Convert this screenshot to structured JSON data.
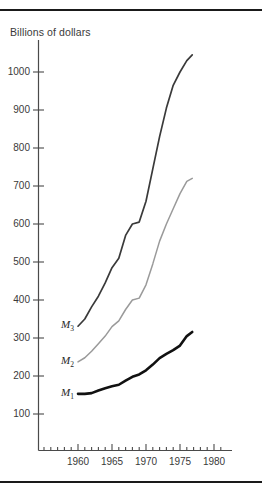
{
  "figure": {
    "axis_title": "Billions of dollars",
    "rule_color": "#1a1a1a"
  },
  "chart_data": {
    "type": "line",
    "title": "",
    "subtitle": "",
    "xlabel": "",
    "ylabel": "Billions of dollars",
    "xlim": [
      1954,
      1982
    ],
    "ylim": [
      0,
      1080
    ],
    "grid": false,
    "legend_position": "inline-left-of-curve-start",
    "yticks": [
      100,
      200,
      300,
      400,
      500,
      600,
      700,
      800,
      900,
      1000
    ],
    "ytick_labels": [
      "100",
      "200",
      "300",
      "400",
      "500",
      "600",
      "700",
      "800",
      "900",
      "1000"
    ],
    "xticks_major": [
      1960,
      1965,
      1970,
      1975,
      1980
    ],
    "xtick_labels": [
      "1960",
      "1965",
      "1970",
      "1975",
      "1980"
    ],
    "xticks_minor_start": 1955,
    "xticks_minor_end": 1981,
    "annotations": [
      {
        "text": "M3",
        "label_html": "M<sub>3</sub>",
        "x": 1960.0,
        "y": 331
      },
      {
        "text": "M2",
        "label_html": "M<sub>2</sub>",
        "x": 1960.0,
        "y": 237
      },
      {
        "text": "M1",
        "label_html": "M<sub>1</sub>",
        "x": 1960.0,
        "y": 153
      }
    ],
    "series": [
      {
        "name": "M3",
        "label_html": "M<sub>3</sub>",
        "color": "#3a3a3a",
        "width": 1.7,
        "x": [
          1960,
          1961,
          1962,
          1963,
          1964,
          1965,
          1966,
          1967,
          1968,
          1969,
          1970,
          1971,
          1972,
          1973,
          1974,
          1975,
          1976,
          1976.8
        ],
        "values": [
          331,
          350,
          382,
          410,
          445,
          485,
          510,
          570,
          600,
          605,
          660,
          745,
          830,
          905,
          965,
          1000,
          1030,
          1045
        ]
      },
      {
        "name": "M2",
        "label_html": "M<sub>2</sub>",
        "color": "#9a9a9a",
        "width": 1.5,
        "x": [
          1960,
          1961,
          1962,
          1963,
          1964,
          1965,
          1966,
          1967,
          1968,
          1969,
          1970,
          1971,
          1972,
          1973,
          1974,
          1975,
          1976,
          1976.8
        ],
        "values": [
          237,
          248,
          265,
          285,
          305,
          330,
          345,
          375,
          400,
          405,
          440,
          495,
          555,
          600,
          640,
          680,
          712,
          720
        ]
      },
      {
        "name": "M1",
        "label_html": "M<sub>1</sub>",
        "color": "#111111",
        "width": 2.6,
        "x": [
          1960,
          1961,
          1962,
          1963,
          1964,
          1965,
          1966,
          1967,
          1968,
          1969,
          1970,
          1971,
          1972,
          1973,
          1974,
          1975,
          1976,
          1976.8
        ],
        "values": [
          153,
          153,
          155,
          162,
          168,
          173,
          177,
          188,
          198,
          204,
          215,
          230,
          247,
          258,
          268,
          280,
          305,
          316
        ]
      }
    ]
  }
}
